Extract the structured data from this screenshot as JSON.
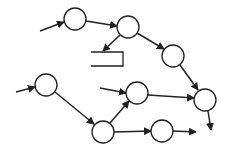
{
  "diagram": {
    "type": "directed-graph",
    "stroke_color": "#222222",
    "fill_color": "#ffffff",
    "node_radius": 11,
    "nodes": [
      {
        "id": "A",
        "cx": 75,
        "cy": 19
      },
      {
        "id": "B",
        "cx": 128,
        "cy": 27
      },
      {
        "id": "C",
        "cx": 173,
        "cy": 56
      },
      {
        "id": "D",
        "cx": 205,
        "cy": 100
      },
      {
        "id": "E",
        "cx": 46,
        "cy": 85
      },
      {
        "id": "F",
        "cx": 103,
        "cy": 132
      },
      {
        "id": "G",
        "cx": 137,
        "cy": 93
      },
      {
        "id": "H",
        "cx": 162,
        "cy": 131
      }
    ],
    "rect": {
      "x1": 91,
      "x2": 123,
      "y1": 52,
      "y2": 66
    },
    "edges": [
      {
        "from": "in1",
        "x1": 40,
        "y1": 31,
        "x2": 64,
        "y2": 22
      },
      {
        "from": "A",
        "to": "B",
        "x1": 86,
        "y1": 21,
        "x2": 117,
        "y2": 26
      },
      {
        "from": "B",
        "to": "rect",
        "x1": 120,
        "y1": 35,
        "x2": 103,
        "y2": 51
      },
      {
        "from": "B",
        "to": "C",
        "x1": 137,
        "y1": 33,
        "x2": 164,
        "y2": 49
      },
      {
        "from": "C",
        "to": "D",
        "x1": 180,
        "y1": 65,
        "x2": 198,
        "y2": 90
      },
      {
        "from": "in2",
        "x1": 16,
        "y1": 92,
        "x2": 35,
        "y2": 87
      },
      {
        "from": "E",
        "to": "F",
        "x1": 55,
        "y1": 92,
        "x2": 94,
        "y2": 124
      },
      {
        "from": "F",
        "to": "G",
        "x1": 110,
        "y1": 123,
        "x2": 129,
        "y2": 101
      },
      {
        "from": "in3",
        "x1": 100,
        "y1": 88,
        "x2": 126,
        "y2": 93
      },
      {
        "from": "G",
        "to": "D",
        "x1": 148,
        "y1": 95,
        "x2": 194,
        "y2": 98
      },
      {
        "from": "F",
        "to": "H",
        "x1": 114,
        "y1": 132,
        "x2": 151,
        "y2": 131
      },
      {
        "from": "H",
        "to": "out1",
        "x1": 173,
        "y1": 131,
        "x2": 196,
        "y2": 132
      },
      {
        "from": "D",
        "to": "out2",
        "x1": 208,
        "y1": 111,
        "x2": 211,
        "y2": 130
      }
    ]
  }
}
